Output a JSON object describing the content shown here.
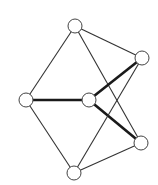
{
  "graph": {
    "colors": {
      "background": "#ffffff",
      "edge": "#333333",
      "node_fill": "#ffffff",
      "node_stroke": "#444444"
    },
    "nodes": [
      {
        "id": "top",
        "x": 75,
        "y": 26
      },
      {
        "id": "upper-right",
        "x": 142,
        "y": 58
      },
      {
        "id": "left",
        "x": 26,
        "y": 100
      },
      {
        "id": "center",
        "x": 89,
        "y": 100
      },
      {
        "id": "lower-right",
        "x": 141,
        "y": 143
      },
      {
        "id": "bottom",
        "x": 74,
        "y": 173
      }
    ],
    "edges": [
      {
        "from": "top",
        "to": "left",
        "thick": false
      },
      {
        "from": "top",
        "to": "upper-right",
        "thick": false
      },
      {
        "from": "top",
        "to": "lower-right",
        "thick": false
      },
      {
        "from": "left",
        "to": "center",
        "thick": true
      },
      {
        "from": "left",
        "to": "bottom",
        "thick": false
      },
      {
        "from": "center",
        "to": "upper-right",
        "thick": true
      },
      {
        "from": "center",
        "to": "lower-right",
        "thick": true
      },
      {
        "from": "upper-right",
        "to": "bottom",
        "thick": false
      },
      {
        "from": "lower-right",
        "to": "bottom",
        "thick": false
      }
    ],
    "node_radius": 7
  }
}
